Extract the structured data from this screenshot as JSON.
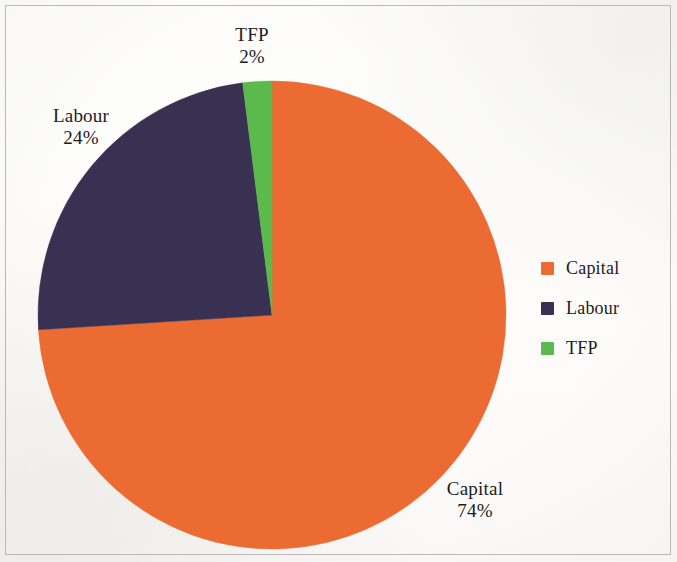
{
  "chart_data": {
    "type": "pie",
    "title": "",
    "subtitle": "",
    "xlabel": "",
    "ylabel": "",
    "legend_position": "right",
    "grid": false,
    "start_angle_deg": 0,
    "direction": "clockwise",
    "categories": [
      "Capital",
      "Labour",
      "TFP"
    ],
    "values": [
      74,
      24,
      2
    ],
    "value_unit": "%",
    "colors": [
      "#ec6b33",
      "#393152",
      "#5cb94b"
    ],
    "slices": [
      {
        "name": "Capital",
        "value": 74,
        "label": "Capital",
        "value_label": "74%",
        "color": "#ec6b33",
        "start_deg": 0,
        "end_deg": 266.4
      },
      {
        "name": "Labour",
        "value": 24,
        "label": "Labour",
        "value_label": "24%",
        "color": "#393152",
        "start_deg": 266.4,
        "end_deg": 352.8
      },
      {
        "name": "TFP",
        "value": 2,
        "label": "TFP",
        "value_label": "2%",
        "color": "#5cb94b",
        "start_deg": 352.8,
        "end_deg": 360
      }
    ],
    "annotations": [
      {
        "name": "TFP",
        "value_label": "2%"
      },
      {
        "name": "Labour",
        "value_label": "24%"
      },
      {
        "name": "Capital",
        "value_label": "74%"
      }
    ]
  },
  "labels": {
    "tfp": {
      "name": "TFP",
      "value": "2%"
    },
    "labour": {
      "name": "Labour",
      "value": "24%"
    },
    "capital": {
      "name": "Capital",
      "value": "74%"
    }
  },
  "legend": {
    "items": [
      {
        "label": "Capital",
        "color": "#ec6b33",
        "swatch_icon": "square-swatch-icon"
      },
      {
        "label": "Labour",
        "color": "#393152",
        "swatch_icon": "square-swatch-icon"
      },
      {
        "label": "TFP",
        "color": "#5cb94b",
        "swatch_icon": "square-swatch-icon"
      }
    ]
  },
  "colors": {
    "capital": "#ec6b33",
    "labour": "#393152",
    "tfp": "#5cb94b",
    "background": "#fdfdfc",
    "frame": "#b9b9b9",
    "text": "#1c1c1c"
  },
  "geometry": {
    "center_x": 272,
    "center_y": 315,
    "radius": 234
  }
}
